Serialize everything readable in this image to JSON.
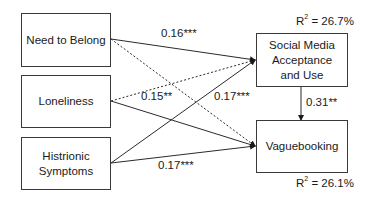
{
  "nodes": {
    "need_to_belong": "Need to Belong",
    "loneliness": "Loneliness",
    "histrionic": "Histrionic Symptoms",
    "social_media": "Social Media Acceptance and Use",
    "vaguebooking": "Vaguebooking"
  },
  "r2": {
    "social_media": {
      "prefix": "R",
      "sup": "2",
      "value": " = 26.7%"
    },
    "vaguebooking": {
      "prefix": "R",
      "sup": "2",
      "value": " = 26.1%"
    }
  },
  "paths": [
    {
      "from": "need_to_belong",
      "to": "social_media",
      "style": "solid",
      "label": "0.16***"
    },
    {
      "from": "need_to_belong",
      "to": "vaguebooking",
      "style": "dashed",
      "label": ""
    },
    {
      "from": "loneliness",
      "to": "social_media",
      "style": "dashed",
      "label": "0.15**"
    },
    {
      "from": "loneliness",
      "to": "vaguebooking",
      "style": "solid",
      "label": ""
    },
    {
      "from": "histrionic",
      "to": "social_media",
      "style": "solid",
      "label": "0.17***"
    },
    {
      "from": "histrionic",
      "to": "vaguebooking",
      "style": "solid",
      "label": "0.17***"
    },
    {
      "from": "social_media",
      "to": "vaguebooking",
      "style": "solid",
      "label": "0.31**"
    }
  ],
  "colors": {
    "line": "#2a2a2a",
    "box_border": "#3a3a3a"
  }
}
